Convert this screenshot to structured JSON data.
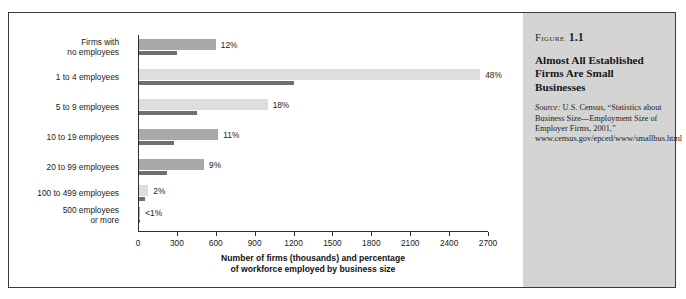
{
  "figure": {
    "label_word": "Figure",
    "number": "1.1",
    "title": "Almost All Established Firms Are Small Businesses",
    "source_word": "Source:",
    "source_text": " U.S. Census, “Statistics about Business Size—Employment Size of Employer Firms, 2001,” www.census.gov/epced/www/smallbus.html"
  },
  "chart_data": {
    "type": "bar",
    "title": "Almost All Established Firms Are Small Businesses",
    "xlabel": "Number of firms (thousands) and percentage of workforce employed by business size",
    "xlabel_line1": "Number of firms (thousands) and percentage",
    "xlabel_line2": "of workforce employed by business size",
    "ylabel": "",
    "xlim": [
      0,
      2700
    ],
    "xticks": [
      0,
      300,
      600,
      900,
      1200,
      1500,
      1800,
      2100,
      2400,
      2700
    ],
    "xtick_labels": [
      "0",
      "300",
      "600",
      "900",
      "1200",
      "1500",
      "1800",
      "2100",
      "2400",
      "2700"
    ],
    "grid": false,
    "legend": "none",
    "orientation": "horizontal",
    "categories": [
      "Firms with no employees",
      "1 to 4 employees",
      "5 to 9 employees",
      "10 to 19 employees",
      "20 to 99 employees",
      "100 to 499 employees",
      "500 employees or more"
    ],
    "category_lines": [
      [
        "Firms with",
        "no employees"
      ],
      [
        "1 to 4 employees"
      ],
      [
        "5 to 9 employees"
      ],
      [
        "10 to 19 employees"
      ],
      [
        "20 to 99 employees"
      ],
      [
        "100 to 499 employees"
      ],
      [
        "500 employees",
        "or more"
      ]
    ],
    "series": [
      {
        "name": "Number of firms (thousands)",
        "values": [
          600,
          2640,
          1000,
          620,
          510,
          80,
          17
        ],
        "color": "#a9a9a9"
      },
      {
        "name": "Percentage of workforce",
        "values": [
          12,
          48,
          18,
          11,
          9,
          2,
          0.5
        ],
        "color": "#6f6f6f"
      }
    ],
    "percent_labels": [
      "12%",
      "48%",
      "18%",
      "11%",
      "9%",
      "2%",
      "<1%"
    ],
    "bar_shades": [
      "medium",
      "light",
      "light",
      "medium",
      "medium",
      "light",
      "medium"
    ]
  }
}
